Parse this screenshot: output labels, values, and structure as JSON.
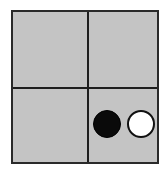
{
  "grid": {
    "rows": 2,
    "cols": 2,
    "background": "#c4c4c4",
    "line_color": "#1e1e1e"
  },
  "cells": [
    {
      "row": 0,
      "col": 0,
      "contents": []
    },
    {
      "row": 0,
      "col": 1,
      "contents": []
    },
    {
      "row": 1,
      "col": 0,
      "contents": []
    },
    {
      "row": 1,
      "col": 1,
      "contents": [
        "black-stone",
        "white-stone"
      ]
    }
  ],
  "stones": [
    {
      "color": "black",
      "hex": "#0a0a0a",
      "cell": [
        1,
        1
      ],
      "position": "left"
    },
    {
      "color": "white",
      "hex": "#ffffff",
      "cell": [
        1,
        1
      ],
      "position": "right"
    }
  ]
}
